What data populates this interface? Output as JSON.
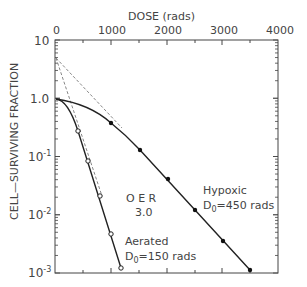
{
  "chart_data": {
    "type": "scatter",
    "title": "",
    "xlabel": "DOSE (rads)",
    "ylabel": "CELL-SURVIVING FRACTION",
    "x_axis_position": "top",
    "xlim": [
      0,
      4000
    ],
    "ylim": [
      0.001,
      10
    ],
    "yscale": "log",
    "x_ticks": [
      "0",
      "1000",
      "2000",
      "3000",
      "4000"
    ],
    "y_ticks": [
      "10",
      "1.0",
      "10^-1",
      "10^-2",
      "10^-3"
    ],
    "grid": false,
    "series": [
      {
        "name": "Aerated",
        "annotation_line1": "Aerated",
        "annotation_line2": "D0=150 rads",
        "marker": "open-circle",
        "x": [
          400,
          600,
          800,
          1000,
          1200
        ],
        "y": [
          0.28,
          0.087,
          0.022,
          0.0048,
          0.0013
        ]
      },
      {
        "name": "Hypoxic",
        "annotation_line1": "Hypoxic",
        "annotation_line2": "D0=450 rads",
        "marker": "filled-circle",
        "x": [
          1000,
          1500,
          2000,
          2500,
          3000,
          3500
        ],
        "y": [
          0.39,
          0.13,
          0.042,
          0.0125,
          0.0037,
          0.0012
        ]
      }
    ],
    "extrapolation_number": 5,
    "annotations": [
      "OER",
      "3.0"
    ]
  },
  "labels": {
    "xlabel": "DOSE (rads)",
    "ylabel": "CELL—SURVIVING FRACTION",
    "xt0": "0",
    "xt1": "1000",
    "xt2": "2000",
    "xt3": "3000",
    "xt4": "4000",
    "yt_top": "10",
    "yt_1": "1.0",
    "hyp1": "Hypoxic",
    "hyp2": "D",
    "hyp2s": "0",
    "hyp2r": "=450 rads",
    "aer1": "Aerated",
    "aer2": "D",
    "aer2s": "0",
    "aer2r": "=150 rads",
    "oer1": "O E R",
    "oer2": "3.0"
  }
}
